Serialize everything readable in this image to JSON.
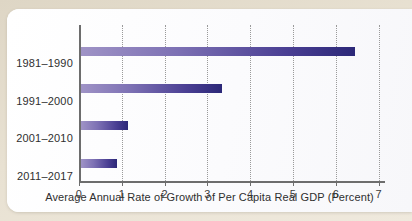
{
  "chart_data": {
    "type": "bar",
    "orientation": "horizontal",
    "title": "",
    "subtitle": "",
    "categories": [
      "1981–1990",
      "1991–2000",
      "2001–2010",
      "2011–2017"
    ],
    "values": [
      6.4,
      3.3,
      1.1,
      0.85
    ],
    "series": [
      {
        "name": "Average Annual Rate of Growth of Per Capita Real GDP",
        "values": [
          6.4,
          3.3,
          1.1,
          0.85
        ]
      }
    ],
    "xlabel": "Average Annual Rate of Growth of Per Capita Real GDP (Percent)",
    "ylabel": "",
    "xlim": [
      0,
      7
    ],
    "xticks": [
      0,
      1,
      2,
      3,
      4,
      5,
      6,
      7
    ],
    "xticklabels": [
      "0",
      "1",
      "2",
      "3",
      "4",
      "5",
      "6",
      "7"
    ],
    "grid": "vertical-dotted",
    "legend": "none",
    "annotations": []
  },
  "style": {
    "bar_gradient_start": "#9f93c6",
    "bar_gradient_end": "#2c2878",
    "page_background": "#e3dccd",
    "card_background": "#fdfdfd",
    "axis_color": "#6d6d6d",
    "gridline_color": "#9a9a9a",
    "text_color": "#2f2f2f"
  }
}
